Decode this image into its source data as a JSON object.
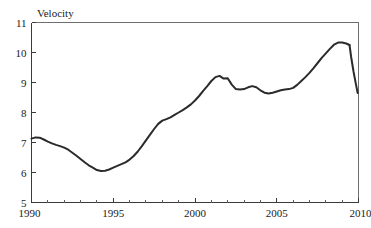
{
  "chart_data": {
    "type": "line",
    "title": "",
    "ylabel": "Velocity",
    "xlabel": "",
    "xlim": [
      1990,
      2010
    ],
    "ylim": [
      5,
      11
    ],
    "grid": false,
    "legend": null,
    "y_ticks": [
      5,
      6,
      7,
      8,
      9,
      10,
      11
    ],
    "y_tick_labels": [
      "5",
      "6",
      "7",
      "8",
      "9",
      "10",
      "11"
    ],
    "x_ticks": [
      1990,
      1995,
      2000,
      2005,
      2010
    ],
    "x_tick_labels": [
      "1990",
      "1995",
      "2000",
      "2005",
      "2010"
    ],
    "x_minor_tick_step": 1,
    "line_color": "#2b2b2b",
    "frame_color": "#6e6e6e",
    "series": [
      {
        "name": "Velocity",
        "x": [
          1990.0,
          1990.25,
          1990.5,
          1990.75,
          1991.0,
          1991.25,
          1991.5,
          1991.75,
          1992.0,
          1992.25,
          1992.5,
          1992.75,
          1993.0,
          1993.25,
          1993.5,
          1993.75,
          1994.0,
          1994.25,
          1994.5,
          1994.75,
          1995.0,
          1995.25,
          1995.5,
          1995.75,
          1996.0,
          1996.25,
          1996.5,
          1996.75,
          1997.0,
          1997.25,
          1997.5,
          1997.75,
          1998.0,
          1998.25,
          1998.5,
          1998.75,
          1999.0,
          1999.25,
          1999.5,
          1999.75,
          2000.0,
          2000.25,
          2000.5,
          2000.75,
          2001.0,
          2001.25,
          2001.5,
          2001.75,
          2002.0,
          2002.25,
          2002.5,
          2002.75,
          2003.0,
          2003.25,
          2003.5,
          2003.75,
          2004.0,
          2004.25,
          2004.5,
          2004.75,
          2005.0,
          2005.25,
          2005.5,
          2005.75,
          2006.0,
          2006.25,
          2006.5,
          2006.75,
          2007.0,
          2007.25,
          2007.5,
          2007.75,
          2008.0,
          2008.25,
          2008.5,
          2008.75,
          2009.0,
          2009.25,
          2009.45
        ],
        "values": [
          7.13,
          7.17,
          7.16,
          7.1,
          7.03,
          6.97,
          6.92,
          6.88,
          6.83,
          6.76,
          6.66,
          6.56,
          6.45,
          6.34,
          6.24,
          6.16,
          6.08,
          6.05,
          6.06,
          6.1,
          6.16,
          6.22,
          6.28,
          6.34,
          6.43,
          6.55,
          6.7,
          6.88,
          7.07,
          7.26,
          7.45,
          7.62,
          7.73,
          7.78,
          7.84,
          7.92,
          8.0,
          8.08,
          8.17,
          8.27,
          8.4,
          8.55,
          8.72,
          8.88,
          9.05,
          9.18,
          9.22,
          9.13,
          9.14,
          8.93,
          8.78,
          8.77,
          8.78,
          8.84,
          8.88,
          8.84,
          8.74,
          8.66,
          8.63,
          8.66,
          8.7,
          8.74,
          8.77,
          8.78,
          8.82,
          8.92,
          9.05,
          9.18,
          9.32,
          9.48,
          9.65,
          9.82,
          9.97,
          10.12,
          10.26,
          10.33,
          10.33,
          10.3,
          10.25
        ]
      },
      {
        "name": "Velocity-tail",
        "x": [
          2009.45,
          2009.55,
          2009.7,
          2009.85,
          2009.95
        ],
        "values": [
          10.25,
          9.85,
          9.35,
          8.92,
          8.65
        ]
      }
    ]
  },
  "figure": {
    "background_color": "#ffffff",
    "width": 371,
    "height": 228
  }
}
